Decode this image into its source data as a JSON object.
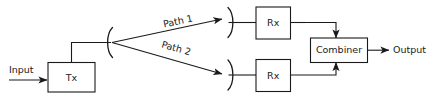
{
  "diagram": {
    "line_color": "#1a1a1a",
    "background_color": "#ffffff",
    "nodes": {
      "input_label": "Input",
      "tx_label": "Tx",
      "rx_top_label": "Rx",
      "rx_bottom_label": "Rx",
      "combiner_label": "Combiner",
      "output_label": "Output"
    },
    "paths": {
      "path_1_label": "Path 1",
      "path_2_label": "Path 2"
    },
    "icons": {
      "tx_antenna": "antenna-arc-icon",
      "rx_top_antenna": "antenna-arc-icon",
      "rx_bottom_antenna": "antenna-arc-icon",
      "input_arrow": "arrow-right-icon",
      "output_arrow": "arrow-right-icon"
    }
  }
}
